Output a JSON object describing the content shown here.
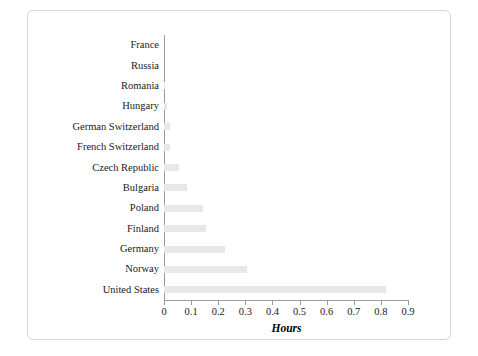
{
  "chart_data": {
    "type": "bar",
    "orientation": "horizontal",
    "title": "",
    "xlabel": "Hours",
    "ylabel": "",
    "xlim": [
      0,
      0.9
    ],
    "xticks": [
      "0",
      "0.1",
      "0.2",
      "0.3",
      "0.4",
      "0.5",
      "0.6",
      "0.7",
      "0.8",
      "0.9"
    ],
    "grid": false,
    "bar_color": "#e8e8e8",
    "categories": [
      "France",
      "Russia",
      "Romania",
      "Hungary",
      "German Switzerland",
      "French Switzerland",
      "Czech Republic",
      "Bulgaria",
      "Poland",
      "Finland",
      "Germany",
      "Norway",
      "United States"
    ],
    "values": [
      0.0,
      0.0,
      0.003,
      0.012,
      0.022,
      0.023,
      0.055,
      0.085,
      0.145,
      0.155,
      0.225,
      0.305,
      0.82
    ]
  },
  "axis": {
    "x_title": "Hours"
  }
}
